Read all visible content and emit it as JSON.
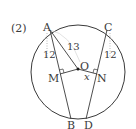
{
  "problem": {
    "number_label": "(2)"
  },
  "diagram": {
    "points": {
      "A": "A",
      "B": "B",
      "C": "C",
      "D": "D",
      "O": "O",
      "M": "M",
      "N": "N"
    },
    "measures": {
      "AM": "12",
      "AO": "13",
      "CN": "12",
      "ON": "x"
    },
    "colors": {
      "stroke": "#3a3a3a",
      "dotted": "#9a9a9a"
    }
  }
}
